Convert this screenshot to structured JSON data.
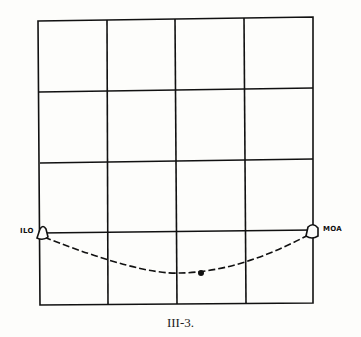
{
  "figure": {
    "caption": "III-3.",
    "grid": {
      "columns": 4,
      "rows": 4
    },
    "stations": [
      {
        "label": "ILO",
        "side": "left"
      },
      {
        "label": "MOA",
        "side": "right"
      }
    ],
    "lines": [
      {
        "type": "solid",
        "from": "ILO",
        "to": "MOA",
        "description": "straight line"
      },
      {
        "type": "dashed",
        "from": "ILO",
        "to": "MOA",
        "description": "curved path dipping below"
      }
    ],
    "marker": {
      "type": "dot",
      "on": "dashed curve"
    }
  },
  "colors": {
    "line": "#111111",
    "background": "#fdfdfb"
  }
}
